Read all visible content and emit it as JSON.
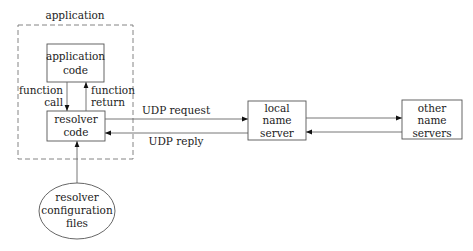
{
  "diagram": {
    "application_group": {
      "label": "application"
    },
    "nodes": {
      "application_code": {
        "line1": "application",
        "line2": "code"
      },
      "resolver_code": {
        "line1": "resolver",
        "line2": "code"
      },
      "local_name_server": {
        "line1": "local",
        "line2": "name",
        "line3": "server"
      },
      "other_name_servers": {
        "line1": "other",
        "line2": "name",
        "line3": "servers"
      },
      "resolver_config": {
        "line1": "resolver",
        "line2": "configuration",
        "line3": "files"
      }
    },
    "edges": {
      "function_call": {
        "line1": "function",
        "line2": "call"
      },
      "function_return": {
        "line1": "function",
        "line2": "return"
      },
      "udp_request": {
        "label": "UDP request"
      },
      "udp_reply": {
        "label": "UDP reply"
      }
    },
    "colors": {
      "stroke": "#555555",
      "text": "#222222",
      "background": "#ffffff"
    }
  }
}
